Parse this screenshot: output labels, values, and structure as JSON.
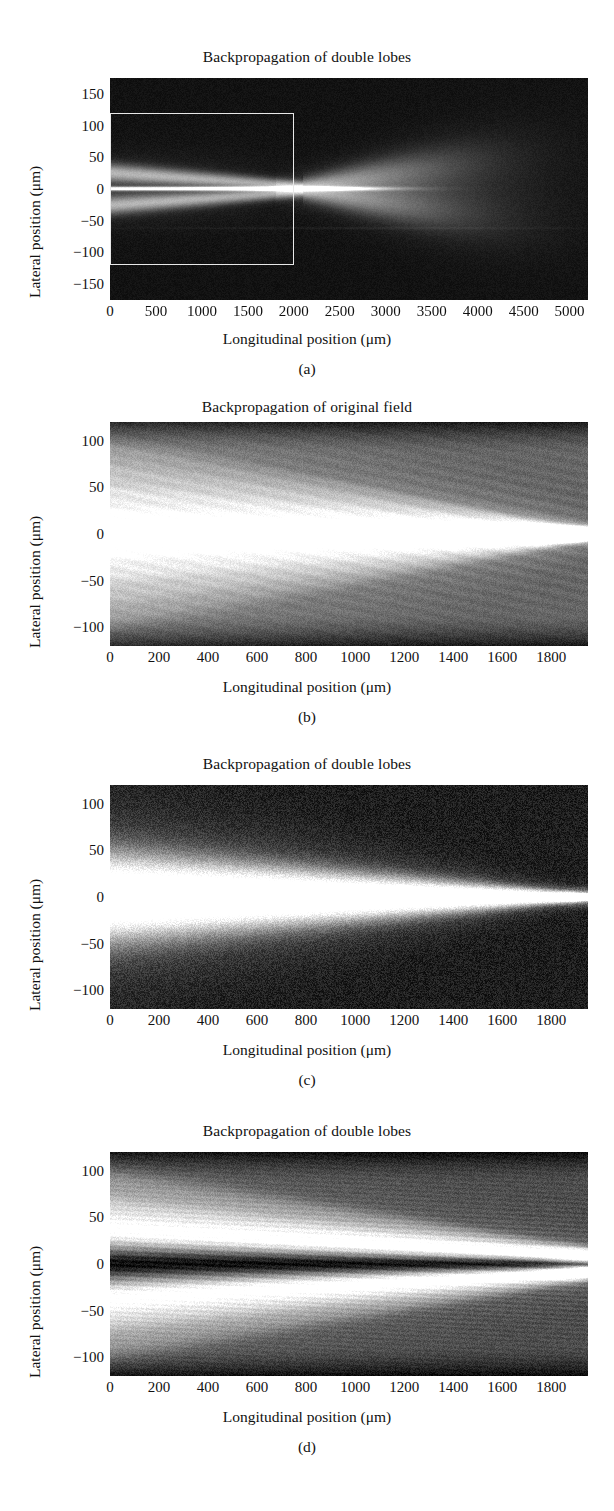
{
  "figure": {
    "axis_label_x": "Longitudinal position (μm)",
    "axis_label_y": "Lateral position (μm)",
    "background": "#ffffff",
    "text_color": "#111111",
    "roi_color": "#e8e8e8"
  },
  "panels": [
    {
      "id": "a",
      "caption": "(a)",
      "title": "Backpropagation of double lobes",
      "xlabel": "Longitudinal position (μm)",
      "ylabel": "Lateral position (μm)",
      "xticks": [
        "0",
        "500",
        "1000",
        "1500",
        "2000",
        "2500",
        "3000",
        "3500",
        "4000",
        "4500",
        "5000"
      ],
      "xtick_values": [
        0,
        500,
        1000,
        1500,
        2000,
        2500,
        3000,
        3500,
        4000,
        4500,
        5000
      ],
      "yticks": [
        "150",
        "100",
        "50",
        "0",
        "−50",
        "−100",
        "−150"
      ],
      "ytick_values": [
        150,
        100,
        50,
        0,
        -50,
        -100,
        -150
      ],
      "xlim": [
        0,
        5200
      ],
      "ylim": [
        -175,
        175
      ],
      "roi": {
        "x0": 0,
        "x1": 2000,
        "y0": -120,
        "y1": 120
      }
    },
    {
      "id": "b",
      "caption": "(b)",
      "title": "Backpropagation of original field",
      "xlabel": "Longitudinal position (μm)",
      "ylabel": "Lateral position (μm)",
      "xticks": [
        "0",
        "200",
        "400",
        "600",
        "800",
        "1000",
        "1200",
        "1400",
        "1600",
        "1800"
      ],
      "xtick_values": [
        0,
        200,
        400,
        600,
        800,
        1000,
        1200,
        1400,
        1600,
        1800
      ],
      "yticks": [
        "100",
        "50",
        "0",
        "−50",
        "−100"
      ],
      "ytick_values": [
        100,
        50,
        0,
        -50,
        -100
      ],
      "xlim": [
        0,
        1950
      ],
      "ylim": [
        -120,
        120
      ]
    },
    {
      "id": "c",
      "caption": "(c)",
      "title": "Backpropagation of double lobes",
      "xlabel": "Longitudinal position (μm)",
      "ylabel": "Lateral position (μm)",
      "xticks": [
        "0",
        "200",
        "400",
        "600",
        "800",
        "1000",
        "1200",
        "1400",
        "1600",
        "1800"
      ],
      "xtick_values": [
        0,
        200,
        400,
        600,
        800,
        1000,
        1200,
        1400,
        1600,
        1800
      ],
      "yticks": [
        "100",
        "50",
        "0",
        "−50",
        "−100"
      ],
      "ytick_values": [
        100,
        50,
        0,
        -50,
        -100
      ],
      "xlim": [
        0,
        1950
      ],
      "ylim": [
        -120,
        120
      ]
    },
    {
      "id": "d",
      "caption": "(d)",
      "title": "Backpropagation of double lobes",
      "xlabel": "Longitudinal position (μm)",
      "ylabel": "Lateral position (μm)",
      "xticks": [
        "0",
        "200",
        "400",
        "600",
        "800",
        "1000",
        "1200",
        "1400",
        "1600",
        "1800"
      ],
      "xtick_values": [
        0,
        200,
        400,
        600,
        800,
        1000,
        1200,
        1400,
        1600,
        1800
      ],
      "yticks": [
        "100",
        "50",
        "0",
        "−50",
        "−100"
      ],
      "ytick_values": [
        100,
        50,
        0,
        -50,
        -100
      ],
      "xlim": [
        0,
        1950
      ],
      "ylim": [
        -120,
        120
      ]
    }
  ],
  "chart_data": [
    {
      "type": "heatmap",
      "panel": "a",
      "title": "Backpropagation of double lobes",
      "xlabel": "Longitudinal position (μm)",
      "ylabel": "Lateral position (μm)",
      "xlim": [
        0,
        5200
      ],
      "ylim": [
        -175,
        175
      ],
      "colormap": "gray",
      "grid": false,
      "description": "Dark field with thin bright axial streak near 0 μm plus two faint diverging lobes that spread toward +50 and -50 μm beyond 2500 μm; white ROI rectangle marks 0-2000 μm by ±120 μm.",
      "features": {
        "axial_streak_y": 0,
        "lobe_centers_at_x0": [
          22,
          -22
        ],
        "lobe_centers_at_x5000": [
          60,
          -60
        ],
        "beam_waist_x": 0,
        "divergence_onset_x": 2300
      }
    },
    {
      "type": "heatmap",
      "panel": "b",
      "title": "Backpropagation of original field",
      "xlabel": "Longitudinal position (μm)",
      "ylabel": "Lateral position (μm)",
      "xlim": [
        0,
        1950
      ],
      "ylim": [
        -120,
        120
      ],
      "colormap": "gray",
      "grid": false,
      "description": "Bright multi-fringe field converging from a wide fan at x=0 to a focus near x=1950; several interference bands above and below the axis, mid-gray background.",
      "features": {
        "fringe_centers_at_x0": [
          0,
          22,
          -22,
          45,
          -45,
          68,
          -68
        ],
        "converges_to_x": 1950,
        "background_level": 0.42,
        "peak_level": 1.0
      }
    },
    {
      "type": "heatmap",
      "panel": "c",
      "title": "Backpropagation of double lobes",
      "xlabel": "Longitudinal position (μm)",
      "ylabel": "Lateral position (μm)",
      "xlim": [
        0,
        1950
      ],
      "ylim": [
        -120,
        120
      ],
      "colormap": "gray",
      "grid": false,
      "description": "Single bright wedge-shaped beam, half-width about 45 μm at x=0 narrowing smoothly to a point focus at x=1950 on a dark noisy background.",
      "features": {
        "half_width_at_x0": 45,
        "half_width_at_x1950": 4,
        "center_y": 0,
        "background_level": 0.12,
        "peak_level": 1.0
      }
    },
    {
      "type": "heatmap",
      "panel": "d",
      "title": "Backpropagation of double lobes",
      "xlabel": "Longitudinal position (μm)",
      "ylabel": "Lateral position (μm)",
      "xlim": [
        0,
        1950
      ],
      "ylim": [
        -120,
        120
      ],
      "colormap": "gray",
      "grid": false,
      "description": "Two bright lobes symmetric about a dark central null line; lobes start near ±35 μm at x=0 and converge toward the axis at x=1950, with finer striations fanning outward.",
      "features": {
        "null_line_y": 0,
        "lobe_centers_at_x0": [
          35,
          -35
        ],
        "lobe_centers_at_x1950": [
          5,
          -5
        ],
        "background_level": 0.3,
        "peak_level": 1.0
      }
    }
  ]
}
